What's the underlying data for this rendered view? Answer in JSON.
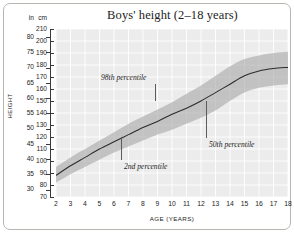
{
  "chart_data": {
    "type": "area",
    "title": "Boys' height (2–18 years)",
    "xlabel": "AGE (YEARS)",
    "ylabel": "HEIGHT",
    "unit_left": "in",
    "unit_right": "cm",
    "grid": true,
    "legend": "none",
    "xlim": [
      2,
      18
    ],
    "ylim_cm": [
      70,
      210
    ],
    "ylim_in": [
      30,
      80
    ],
    "x_ticks": [
      2,
      3,
      4,
      5,
      6,
      7,
      8,
      9,
      10,
      11,
      12,
      13,
      14,
      15,
      16,
      17,
      18
    ],
    "y_ticks_cm": [
      70,
      80,
      90,
      100,
      110,
      120,
      130,
      140,
      150,
      160,
      170,
      180,
      190,
      200,
      210
    ],
    "y_ticks_in": [
      30,
      35,
      40,
      45,
      50,
      55,
      60,
      65,
      70,
      75,
      80
    ],
    "x": [
      2,
      3,
      4,
      5,
      6,
      7,
      8,
      9,
      10,
      11,
      12,
      13,
      14,
      15,
      16,
      17,
      18
    ],
    "series": [
      {
        "name": "2nd percentile",
        "unit": "cm",
        "values": [
          82,
          89,
          95,
          101,
          107,
          112,
          117,
          122,
          126,
          131,
          136,
          142,
          150,
          157,
          161,
          163,
          164
        ]
      },
      {
        "name": "50th percentile",
        "unit": "cm",
        "values": [
          88,
          96,
          103,
          110,
          116,
          122,
          128,
          133,
          139,
          144,
          150,
          157,
          164,
          171,
          175,
          177,
          178
        ]
      },
      {
        "name": "98th percentile",
        "unit": "cm",
        "values": [
          95,
          103,
          110,
          117,
          124,
          131,
          137,
          143,
          149,
          156,
          163,
          171,
          179,
          185,
          188,
          190,
          191
        ]
      }
    ],
    "annotations": [
      {
        "text": "98th percentile",
        "x": 9.7,
        "y_cm": 163
      },
      {
        "text": "2nd percentile",
        "x": 7.3,
        "y_cm": 95
      },
      {
        "text": "50th percentile",
        "x": 13.4,
        "y_cm": 117
      }
    ],
    "colors": {
      "plot_background": "#ececec",
      "gridline": "#ffffff",
      "band": "#a8a8a8",
      "median_line": "#2b2b2b",
      "axis": "#3a3a3a",
      "text": "#1d1d1d",
      "frame": "#b9b6b1"
    }
  }
}
